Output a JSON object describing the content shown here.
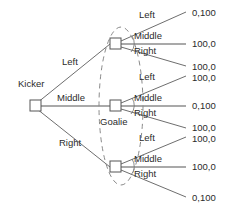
{
  "figure": {
    "type": "extensive-form-game-tree",
    "background_color": "#ffffff",
    "line_color": "#6e6e6e",
    "text_color": "#2b2b2b",
    "dash_color": "#8a8a8a"
  },
  "players": {
    "kicker_label": "Kicker",
    "goalie_label": "Goalie"
  },
  "kicker_actions": [
    {
      "label": "Left"
    },
    {
      "label": "Middle"
    },
    {
      "label": "Right"
    }
  ],
  "goalie_nodes": [
    {
      "after_kicker": "Left",
      "actions": [
        {
          "label": "Left",
          "payoff": "0,100"
        },
        {
          "label": "Middle",
          "payoff": "100,0"
        },
        {
          "label": "Right",
          "payoff": "100,0"
        }
      ]
    },
    {
      "after_kicker": "Middle",
      "actions": [
        {
          "label": "Left",
          "payoff": "100,0"
        },
        {
          "label": "Middle",
          "payoff": "0,100"
        },
        {
          "label": "Right",
          "payoff": "100,0"
        }
      ]
    },
    {
      "after_kicker": "Right",
      "actions": [
        {
          "label": "Left",
          "payoff": "100,0"
        },
        {
          "label": "Middle",
          "payoff": "100,0"
        },
        {
          "label": "Right",
          "payoff": "0,100"
        }
      ]
    }
  ],
  "payoffs_in_order": [
    "0,100",
    "100,0",
    "100,0",
    "100,0",
    "0,100",
    "100,0",
    "100,0",
    "100,0",
    "0,100"
  ],
  "information_set": {
    "note": "dashed oval enclosing the three goalie decision nodes"
  }
}
